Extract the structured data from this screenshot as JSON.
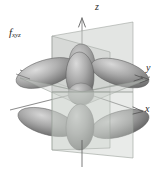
{
  "figure": {
    "kind": "atomic-orbital-diagram",
    "orbital_symbol": "f",
    "orbital_subscript": "xyz",
    "background_color": "#ffffff",
    "axes": [
      {
        "name": "z",
        "label": "z",
        "direction": "up",
        "arrow": true
      },
      {
        "name": "y",
        "label": "y",
        "direction": "right",
        "arrow": true
      },
      {
        "name": "x",
        "label": "x",
        "direction": "lower-right",
        "arrow": true
      }
    ],
    "lobe_count": 8,
    "nodal_plane_count": 3,
    "colors": {
      "lobe_light": "#d2d2d2",
      "lobe_mid": "#a8a8a8",
      "lobe_dark": "#6f6f6f",
      "lobe_edge": "#5d5d5d",
      "plane_fill": "#c9cdc9",
      "plane_edge": "#9aa09a",
      "axis_line": "#555555",
      "label_text": "#2b2b2b"
    }
  }
}
